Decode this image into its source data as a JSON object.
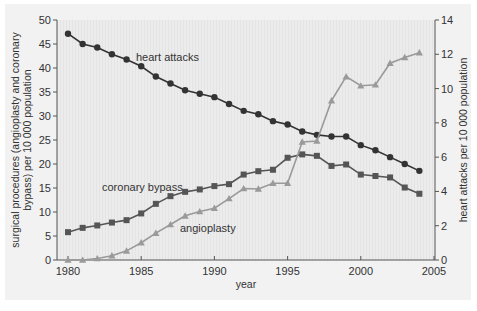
{
  "chart_data": {
    "type": "line",
    "title": "",
    "xlabel": "year",
    "ylabel": "surgical procedures (angioplasty and coronary bypass) per 10 000 population",
    "ylabel_right": "heart attacks per 10 000 population",
    "xlim": [
      1980,
      2005
    ],
    "ylim": [
      0,
      50
    ],
    "ylim_right": [
      0,
      14
    ],
    "x_ticks": [
      1980,
      1985,
      1990,
      1995,
      2000,
      2005
    ],
    "y_ticks": [
      0,
      5,
      10,
      15,
      20,
      25,
      30,
      35,
      40,
      45,
      50
    ],
    "y_ticks_right": [
      0,
      2,
      4,
      6,
      8,
      10,
      12,
      14
    ],
    "grid": false,
    "legend": "inline labels",
    "x": [
      1980,
      1981,
      1982,
      1983,
      1984,
      1985,
      1986,
      1987,
      1988,
      1989,
      1990,
      1991,
      1992,
      1993,
      1994,
      1995,
      1996,
      1997,
      1998,
      1999,
      2000,
      2001,
      2002,
      2003,
      2004
    ],
    "series": [
      {
        "name": "heart attacks",
        "axis": "right",
        "marker": "circle",
        "color": "#333333",
        "values": [
          13.2,
          12.6,
          12.4,
          12.0,
          11.7,
          11.3,
          10.7,
          10.3,
          9.9,
          9.7,
          9.5,
          9.1,
          8.7,
          8.5,
          8.1,
          7.9,
          7.5,
          7.3,
          7.2,
          7.2,
          6.7,
          6.4,
          6.0,
          5.6,
          5.2
        ]
      },
      {
        "name": "coronary bypass",
        "axis": "left",
        "marker": "square",
        "color": "#555555",
        "values": [
          5.8,
          6.7,
          7.2,
          7.8,
          8.3,
          9.7,
          11.7,
          13.3,
          14.2,
          14.7,
          15.4,
          15.8,
          17.8,
          18.5,
          18.8,
          21.3,
          22.0,
          21.7,
          19.6,
          19.9,
          17.8,
          17.5,
          17.2,
          15.1,
          13.8
        ]
      },
      {
        "name": "angioplasty",
        "axis": "left",
        "marker": "triangle",
        "color": "#9a9a9a",
        "values": [
          0.0,
          0.0,
          0.3,
          0.9,
          1.9,
          3.6,
          5.6,
          7.4,
          9.2,
          10.1,
          10.8,
          12.8,
          14.9,
          14.8,
          16.0,
          16.0,
          24.6,
          24.8,
          33.2,
          38.2,
          36.3,
          36.5,
          41.0,
          42.2,
          43.2
        ]
      }
    ],
    "labels": {
      "heart_attacks": "heart attacks",
      "coronary_bypass": "coronary bypass",
      "angioplasty": "angioplasty"
    }
  },
  "colors": {
    "panel_bg": "#f2f2f2",
    "plot_bg": "#ebebeb",
    "axis": "#555555"
  }
}
